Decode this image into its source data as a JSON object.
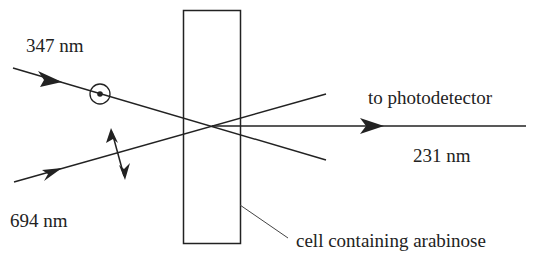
{
  "diagram": {
    "labels": {
      "beam_uv": "347 nm",
      "beam_red": "694 nm",
      "output_direction": "to photodetector",
      "output_wavelength": "231 nm",
      "cell": "cell containing arabinose"
    },
    "elements": {
      "beam_347_polarization": "perpendicular (dot in circle, out of page)",
      "beam_694_polarization": "in-plane (double-headed arrow)",
      "cell": "rectangular sample cell"
    },
    "colors": {
      "line": "#222222",
      "background": "#ffffff"
    }
  }
}
